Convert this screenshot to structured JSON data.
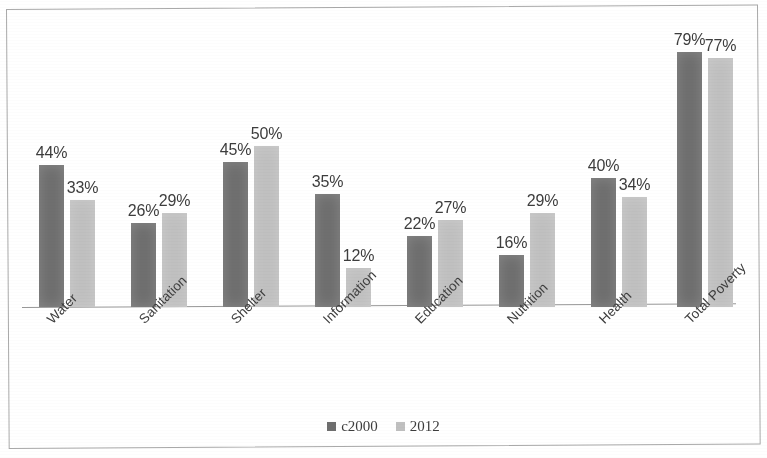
{
  "chart_data": {
    "type": "bar",
    "title": "",
    "subtitle": "",
    "xlabel": "",
    "ylabel": "",
    "ylim": [
      0,
      85
    ],
    "grid": false,
    "legend_position": "bottom-center",
    "value_suffix": "%",
    "categories": [
      "Water",
      "Sanitation",
      "Shelter",
      "Information",
      "Education",
      "Nutrition",
      "Health",
      "Total Poverty"
    ],
    "series": [
      {
        "name": "c2000",
        "color": "#6e6e6e",
        "values": [
          44,
          26,
          45,
          35,
          22,
          16,
          40,
          79
        ]
      },
      {
        "name": "2012",
        "color": "#c0c0c0",
        "values": [
          33,
          29,
          50,
          12,
          27,
          29,
          34,
          77
        ]
      }
    ],
    "data_labels": [
      [
        "44%",
        "26%",
        "45%",
        "35%",
        "22%",
        "16%",
        "40%",
        "79%"
      ],
      [
        "33%",
        "29%",
        "50%",
        "12%",
        "27%",
        "29%",
        "34%",
        "77%"
      ]
    ]
  },
  "legend": {
    "items": [
      {
        "label": "c2000",
        "color": "#6e6e6e"
      },
      {
        "label": "2012",
        "color": "#c0c0c0"
      }
    ]
  }
}
